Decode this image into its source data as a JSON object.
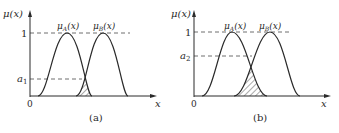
{
  "panels": [
    {
      "id": "a",
      "caption": "(a)",
      "y_axis_label": "μ(x)",
      "x_axis_label": "x",
      "origin_label": "0",
      "level_one_label": "1",
      "cut_label": "a",
      "cut_subscript": "1",
      "curve_a_label": "μ",
      "curve_a_sub": "A",
      "curve_a_arg": "(x)",
      "curve_b_label": "μ",
      "curve_b_sub": "B",
      "curve_b_arg": "(x)"
    },
    {
      "id": "b",
      "caption": "(b)",
      "y_axis_label": "μ(x)",
      "x_axis_label": "x",
      "origin_label": "0",
      "level_one_label": "1",
      "cut_label": "a",
      "cut_subscript": "2",
      "curve_a_label": "μ",
      "curve_a_sub": "A",
      "curve_a_arg": "(x)",
      "curve_b_label": "μ",
      "curve_b_sub": "B",
      "curve_b_arg": "(x)"
    }
  ],
  "colors": {
    "line": "#2a2a2a",
    "dash": "#4a4a4a",
    "background": "#ffffff"
  }
}
